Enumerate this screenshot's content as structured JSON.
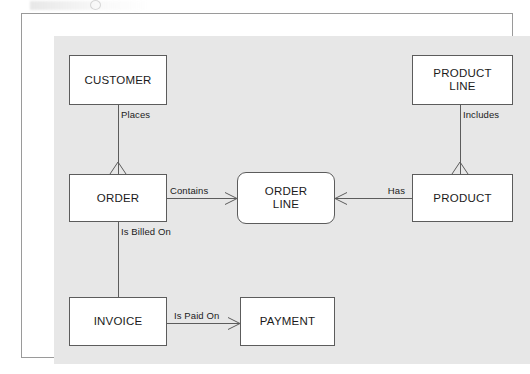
{
  "diagram": {
    "title_visible": false,
    "type": "entity-relationship-diagram",
    "notation": "crow's foot",
    "background_color": "#e7e7e7",
    "frame_color": "#9a9a9a",
    "line_color": "#5c5c5c",
    "entity_fill": "#ffffff",
    "entities": [
      {
        "id": "customer",
        "label": "CUSTOMER",
        "shape": "rectangle",
        "x": 47,
        "y": 41,
        "w": 98,
        "h": 50
      },
      {
        "id": "product_line",
        "label": "PRODUCT\nLINE",
        "shape": "rectangle",
        "x": 390,
        "y": 41,
        "w": 101,
        "h": 50
      },
      {
        "id": "order",
        "label": "ORDER",
        "shape": "rectangle",
        "x": 47,
        "y": 160,
        "w": 98,
        "h": 48
      },
      {
        "id": "order_line",
        "label": "ORDER\nLINE",
        "shape": "rounded-rectangle",
        "x": 215,
        "y": 158,
        "w": 98,
        "h": 52
      },
      {
        "id": "product",
        "label": "PRODUCT",
        "shape": "rectangle",
        "x": 390,
        "y": 160,
        "w": 101,
        "h": 48
      },
      {
        "id": "invoice",
        "label": "INVOICE",
        "shape": "rectangle",
        "x": 47,
        "y": 283,
        "w": 98,
        "h": 49
      },
      {
        "id": "payment",
        "label": "PAYMENT",
        "shape": "rectangle",
        "x": 218,
        "y": 283,
        "w": 95,
        "h": 49
      }
    ],
    "relationships": [
      {
        "id": "places",
        "label": "Places",
        "from": "customer",
        "to": "order",
        "orientation": "vertical",
        "many_end": "order"
      },
      {
        "id": "is_billed_on",
        "label": "Is Billed On",
        "from": "order",
        "to": "invoice",
        "orientation": "vertical",
        "many_end": "none"
      },
      {
        "id": "contains",
        "label": "Contains",
        "from": "order",
        "to": "order_line",
        "orientation": "horizontal",
        "many_end": "order_line"
      },
      {
        "id": "has",
        "label": "Has",
        "from": "order_line",
        "to": "product",
        "orientation": "horizontal",
        "many_end": "order_line"
      },
      {
        "id": "includes",
        "label": "Includes",
        "from": "product_line",
        "to": "product",
        "orientation": "vertical",
        "many_end": "product"
      },
      {
        "id": "is_paid_on",
        "label": "Is Paid On",
        "from": "invoice",
        "to": "payment",
        "orientation": "horizontal",
        "many_end": "payment"
      }
    ]
  }
}
